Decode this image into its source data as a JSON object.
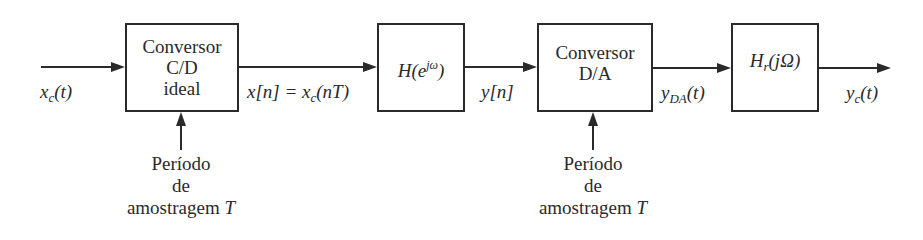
{
  "diagram": {
    "type": "block-diagram",
    "blocks": [
      {
        "id": "cd",
        "lines": [
          "Conversor",
          "C/D",
          "ideal"
        ]
      },
      {
        "id": "h",
        "label": "H(e^{jω})",
        "parts": {
          "main": "H(e",
          "sup": "jω",
          "close": ")"
        }
      },
      {
        "id": "da",
        "lines": [
          "Conversor",
          "D/A"
        ]
      },
      {
        "id": "hr",
        "label": "H_r(jΩ)",
        "parts": {
          "main": "H",
          "sub": "r",
          "rest": "(jΩ)"
        }
      }
    ],
    "signals": {
      "input": {
        "label": "x_c(t)",
        "main": "x",
        "sub": "c",
        "rest": "(t)"
      },
      "xn": {
        "label": "x[n] = x_c(nT)",
        "left": "x[n] = x",
        "sub": "c",
        "rest": "(nT)"
      },
      "yn": {
        "label": "y[n]",
        "text": "y[n]"
      },
      "yda": {
        "label": "y_DA(t)",
        "main": "y",
        "sub": "DA",
        "rest": "(t)"
      },
      "output": {
        "label": "y_c(t)",
        "main": "y",
        "sub": "c",
        "rest": "(t)"
      }
    },
    "captions": {
      "cd": {
        "lines": [
          "Período",
          "de",
          "amostragem"
        ],
        "var": "T"
      },
      "da": {
        "lines": [
          "Período",
          "de",
          "amostragem"
        ],
        "var": "T"
      }
    },
    "edges": [
      [
        "input",
        "cd"
      ],
      [
        "cd",
        "h"
      ],
      [
        "h",
        "da"
      ],
      [
        "da",
        "hr"
      ],
      [
        "hr",
        "output"
      ],
      [
        "caption-cd",
        "cd"
      ],
      [
        "caption-da",
        "da"
      ]
    ]
  }
}
